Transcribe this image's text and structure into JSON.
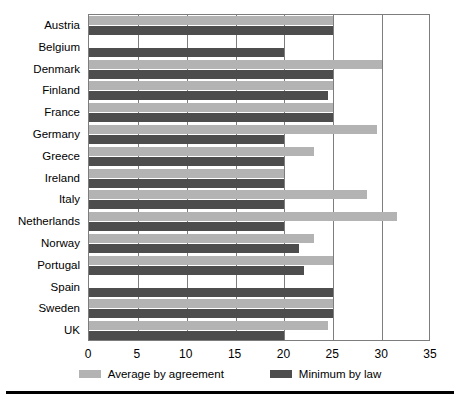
{
  "chart_data": {
    "type": "bar",
    "orientation": "horizontal",
    "title": "",
    "xlabel": "",
    "ylabel": "",
    "xlim": [
      0,
      35
    ],
    "xticks": [
      "0",
      "5",
      "10",
      "15",
      "20",
      "25",
      "30",
      "35"
    ],
    "grid": true,
    "legend_position": "bottom",
    "categories": [
      "Austria",
      "Belgium",
      "Denmark",
      "Finland",
      "France",
      "Germany",
      "Greece",
      "Ireland",
      "Italy",
      "Netherlands",
      "Norway",
      "Portugal",
      "Spain",
      "Sweden",
      "UK"
    ],
    "series": [
      {
        "name": "Average by agreement",
        "color": "#b3b3b3",
        "values": [
          25,
          0,
          30,
          25,
          25,
          29.5,
          23,
          20,
          28.5,
          31.5,
          23,
          25,
          0,
          25,
          24.5
        ]
      },
      {
        "name": "Minimum by law",
        "color": "#4d4d4d",
        "values": [
          25,
          20,
          25,
          24.5,
          25,
          20,
          20,
          20,
          20,
          20,
          21.5,
          22,
          25,
          25,
          20
        ]
      }
    ]
  },
  "legend": {
    "items": [
      {
        "label": "Average by agreement",
        "swatch": "avg"
      },
      {
        "label": "Minimum by law",
        "swatch": "min"
      }
    ]
  }
}
